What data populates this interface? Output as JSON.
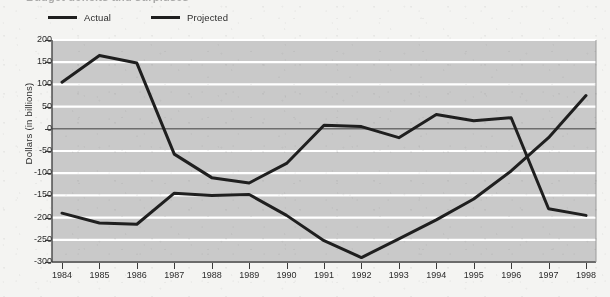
{
  "title": {
    "text": "Budget deficits and surpluses",
    "visible_partial": true
  },
  "legend": {
    "position": "top-left",
    "items": [
      {
        "label": "Actual",
        "color": "#1f1f1f",
        "icon": "line-swatch"
      },
      {
        "label": "Projected",
        "color": "#1f1f1f",
        "icon": "line-swatch"
      }
    ]
  },
  "axes": {
    "ylabel": "Dollars (in billions)",
    "xlabel": "",
    "yticks": [
      "200",
      "150",
      "100",
      "50",
      "0",
      "-50",
      "-100",
      "-150",
      "-200",
      "-250",
      "-300"
    ],
    "xticks": [
      "1984",
      "1985",
      "1986",
      "1987",
      "1988",
      "1989",
      "1990",
      "1991",
      "1992",
      "1993",
      "1994",
      "1995",
      "1996",
      "1997",
      "1998"
    ]
  },
  "style": {
    "plot_background": "#c9c9c9",
    "gridline_color": "#ffffff",
    "zero_line_color": "#6e6e6e",
    "line_color": "#1f1f1f",
    "page_background": "#f4f4f2"
  },
  "chart_data": {
    "type": "line",
    "title": "Budget deficits and surpluses",
    "xlabel": "",
    "ylabel": "Dollars (in billions)",
    "ylim": [
      -300,
      200
    ],
    "xlim": [
      "1984",
      "1998"
    ],
    "grid": true,
    "legend_position": "top-left",
    "x": [
      "1984",
      "1985",
      "1986",
      "1987",
      "1988",
      "1989",
      "1990",
      "1991",
      "1992",
      "1993",
      "1994",
      "1995",
      "1996",
      "1997",
      "1998"
    ],
    "series": [
      {
        "name": "Actual",
        "color": "#1f1f1f",
        "values": [
          105,
          165,
          148,
          -57,
          -110,
          -122,
          -78,
          8,
          5,
          -20,
          32,
          18,
          25,
          -180,
          -195
        ]
      },
      {
        "name": "Projected",
        "color": "#1f1f1f",
        "values": [
          -190,
          -212,
          -215,
          -145,
          -150,
          -148,
          -195,
          -252,
          -290,
          -248,
          -205,
          -158,
          -95,
          -20,
          75
        ]
      }
    ]
  }
}
